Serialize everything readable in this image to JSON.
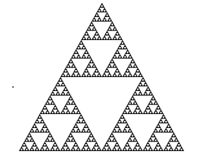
{
  "figure": {
    "fill_color": "#1a1a1a",
    "background_color": "#ffffff",
    "vertices": {
      "apex": [
        102,
        3
      ],
      "bottom_left": [
        19,
        151
      ],
      "bottom_right": [
        184,
        151
      ]
    },
    "recursion_depth": 6
  },
  "artifact_dot": {
    "x": 12,
    "y": 86,
    "color": "#9a9a9a"
  }
}
